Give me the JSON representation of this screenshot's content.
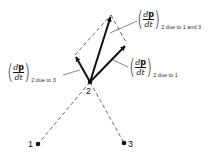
{
  "diagram": {
    "points": [
      {
        "id": "1",
        "label": "1",
        "x": 38,
        "y": 144
      },
      {
        "id": "2",
        "label": "2",
        "x": 90,
        "y": 82
      },
      {
        "id": "3",
        "label": "3",
        "x": 124,
        "y": 143
      }
    ],
    "vectors": [
      {
        "id": "due-to-3",
        "from": [
          90,
          82
        ],
        "to": [
          75,
          55
        ]
      },
      {
        "id": "due-to-1",
        "from": [
          90,
          82
        ],
        "to": [
          127,
          44
        ]
      },
      {
        "id": "due-to-1-and-3",
        "from": [
          90,
          82
        ],
        "to": [
          111,
          15
        ]
      }
    ],
    "labels": {
      "top": {
        "numerator_italic": "d",
        "numerator_bold": "p",
        "denominator": "dt",
        "subscript": "2 due to 1 and 3"
      },
      "right": {
        "numerator_italic": "d",
        "numerator_bold": "p",
        "denominator": "dt",
        "subscript": "2 due to 1"
      },
      "left": {
        "numerator_italic": "d",
        "numerator_bold": "p",
        "denominator": "dt",
        "subscript": "2 due to 3"
      }
    },
    "colors": {
      "ink": "#111111",
      "dashed": "#444444",
      "leader": "#555555",
      "background": "#ffffff"
    }
  }
}
